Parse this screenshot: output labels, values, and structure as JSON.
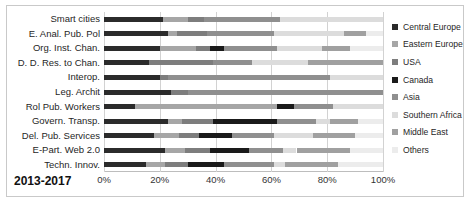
{
  "period_label": "2013-2017",
  "axis": {
    "ticks": [
      "0%",
      "20%",
      "40%",
      "60%",
      "80%",
      "100%"
    ],
    "tick_values": [
      0,
      20,
      40,
      60,
      80,
      100
    ],
    "min": 0,
    "max": 100
  },
  "legend": {
    "items": [
      {
        "label": "Central Europe",
        "color": "#2b2b2b"
      },
      {
        "label": "Eastern Europe",
        "color": "#a6a6a6"
      },
      {
        "label": "USA",
        "color": "#7d7d7d"
      },
      {
        "label": "Canada",
        "color": "#1a1a1a"
      },
      {
        "label": "Asia",
        "color": "#8f8f8f"
      },
      {
        "label": "Southern Africa",
        "color": "#dcdcdc"
      },
      {
        "label": "Middle East",
        "color": "#a0a0a0"
      },
      {
        "label": "Others",
        "color": "#ececec"
      }
    ]
  },
  "chart_data": {
    "type": "bar",
    "title": "",
    "subtitle": "",
    "xlabel": "",
    "ylabel": "",
    "orientation": "horizontal",
    "stacked": true,
    "normalized_percent": true,
    "grid": true,
    "legend_position": "right",
    "xlim": [
      0,
      100
    ],
    "categories": [
      "Smart cities",
      "E. Anal. Pub. Pol",
      "Org. Inst. Chan.",
      "D. D. Res. to Chan.",
      "Interop.",
      "Leg. Archit",
      "Rol Pub. Workers",
      "Govern. Transp.",
      "Del. Pub. Services",
      "E-Part. Web 2.0",
      "Techn. Innov."
    ],
    "series": [
      {
        "name": "Central Europe",
        "color": "#2b2b2b",
        "values": [
          21,
          23,
          20,
          16,
          20,
          24,
          11,
          23,
          18,
          22,
          15
        ]
      },
      {
        "name": "Eastern Europe",
        "color": "#a6a6a6",
        "values": [
          9,
          3,
          13,
          0,
          0,
          0,
          51,
          5,
          9,
          7,
          7
        ]
      },
      {
        "name": "USA",
        "color": "#7d7d7d",
        "values": [
          6,
          11,
          5,
          23,
          3,
          6,
          0,
          11,
          7,
          9,
          8
        ]
      },
      {
        "name": "Canada",
        "color": "#1a1a1a",
        "values": [
          0,
          0,
          5,
          0,
          0,
          0,
          6,
          23,
          12,
          14,
          13
        ]
      },
      {
        "name": "Asia",
        "color": "#8f8f8f",
        "values": [
          27,
          24,
          19,
          14,
          58,
          70,
          14,
          14,
          15,
          12,
          18
        ]
      },
      {
        "name": "Southern Africa",
        "color": "#dcdcdc",
        "values": [
          37,
          25,
          16,
          20,
          19,
          0,
          18,
          5,
          14,
          5,
          4
        ]
      },
      {
        "name": "Middle East",
        "color": "#a0a0a0",
        "values": [
          0,
          8,
          10,
          27,
          0,
          0,
          0,
          10,
          15,
          19,
          19
        ]
      },
      {
        "name": "Others",
        "color": "#ececec",
        "values": [
          0,
          6,
          12,
          0,
          0,
          0,
          0,
          9,
          10,
          12,
          16
        ]
      }
    ]
  }
}
